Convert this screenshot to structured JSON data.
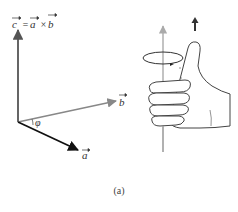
{
  "figure": {
    "equation": {
      "c": "c",
      "eq": "=",
      "a": "a",
      "times": "×",
      "b": "b"
    },
    "vectors": {
      "a_label": "a",
      "b_label": "b",
      "angle_label": "φ"
    },
    "caption": "(a)",
    "colors": {
      "vector_c": "#555555",
      "vector_a": "#111111",
      "vector_b": "#888888",
      "hand_outline": "#444444",
      "axis": "#999999"
    }
  }
}
